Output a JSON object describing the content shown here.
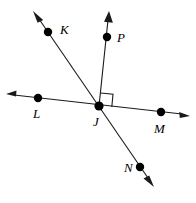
{
  "figure": {
    "type": "geometry-diagram",
    "background_color": "#ffffff",
    "stroke_color": "#1a1a1a",
    "point_color": "#000000",
    "width": 196,
    "height": 203
  },
  "points": [
    {
      "id": "K",
      "label": "K",
      "x": 48,
      "y": 32,
      "label_x": 60,
      "label_y": 34
    },
    {
      "id": "P",
      "label": "P",
      "x": 107,
      "y": 37,
      "label_x": 117,
      "label_y": 42
    },
    {
      "id": "L",
      "label": "L",
      "x": 38,
      "y": 98,
      "label_x": 33,
      "label_y": 118
    },
    {
      "id": "J",
      "label": "J",
      "x": 99,
      "y": 106,
      "label_x": 93,
      "label_y": 126
    },
    {
      "id": "M",
      "label": "M",
      "x": 161,
      "y": 112,
      "label_x": 154,
      "label_y": 133
    },
    {
      "id": "N",
      "label": "N",
      "x": 140,
      "y": 167,
      "label_x": 124,
      "label_y": 172
    }
  ],
  "lines": [
    {
      "id": "line-KN",
      "name": "line-k-j-n",
      "through": [
        "K",
        "J",
        "N"
      ],
      "x1": 35,
      "y1": 14,
      "x2": 152,
      "y2": 183,
      "arrow_start": true,
      "arrow_end": true
    },
    {
      "id": "line-LM",
      "name": "line-l-j-m",
      "through": [
        "L",
        "J",
        "M"
      ],
      "x1": 9,
      "y1": 95,
      "x2": 187,
      "y2": 115,
      "arrow_start": true,
      "arrow_end": true
    },
    {
      "id": "ray-JP",
      "name": "ray-j-p",
      "through": [
        "J",
        "P"
      ],
      "x1": 99,
      "y1": 106,
      "x2": 109,
      "y2": 14,
      "arrow_start": false,
      "arrow_end": true
    }
  ],
  "right_angle": {
    "id": "right-angle-J",
    "vertex": "J",
    "between": [
      "ray-JP",
      "ray-JM"
    ],
    "measure": "90",
    "size": 13
  },
  "annotations": {
    "vertex_label": "J",
    "point_labels": [
      "K",
      "P",
      "L",
      "J",
      "M",
      "N"
    ]
  }
}
